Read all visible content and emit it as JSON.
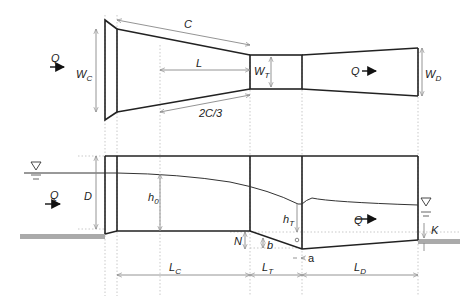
{
  "plan_view": {
    "flow_label": "Q",
    "labels": {
      "C": "C",
      "L": "L",
      "two_c_3": "2C/3",
      "Wc_main": "W",
      "Wc_sub": "C",
      "Wt_main": "W",
      "Wt_sub": "T",
      "Wd_main": "W",
      "Wd_sub": "D",
      "Q_right": "Q"
    }
  },
  "profile_view": {
    "labels": {
      "Q_left": "Q",
      "D": "D",
      "h0_main": "h",
      "h0_sub": "0",
      "hT_main": "h",
      "hT_sub": "T",
      "Q_right": "Q",
      "N": "N",
      "b": "b",
      "a": "a",
      "K": "K",
      "Lc_main": "L",
      "Lc_sub": "C",
      "Lt_main": "L",
      "Lt_sub": "T",
      "Ld_main": "L",
      "Ld_sub": "D"
    }
  },
  "colors": {
    "line": "#222222",
    "dim": "#888888",
    "ground": "#aaaaaa"
  }
}
